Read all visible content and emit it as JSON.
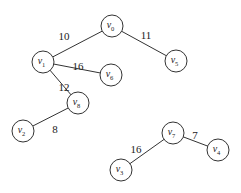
{
  "diagram": {
    "type": "weighted-graph",
    "node_radius": 11,
    "colors": {
      "stroke": "#333333",
      "fill": "#ffffff",
      "text": "#222222"
    },
    "nodes": [
      {
        "id": "v0",
        "label": "v",
        "sub": "0",
        "x": 112,
        "y": 26
      },
      {
        "id": "v1",
        "label": "v",
        "sub": "1",
        "x": 43,
        "y": 62
      },
      {
        "id": "v5",
        "label": "v",
        "sub": "5",
        "x": 176,
        "y": 61
      },
      {
        "id": "v6",
        "label": "v",
        "sub": "6",
        "x": 111,
        "y": 75
      },
      {
        "id": "v8",
        "label": "v",
        "sub": "8",
        "x": 78,
        "y": 103
      },
      {
        "id": "v2",
        "label": "v",
        "sub": "2",
        "x": 23,
        "y": 131
      },
      {
        "id": "v7",
        "label": "v",
        "sub": "7",
        "x": 173,
        "y": 133
      },
      {
        "id": "v3",
        "label": "v",
        "sub": "3",
        "x": 121,
        "y": 170
      },
      {
        "id": "v4",
        "label": "v",
        "sub": "4",
        "x": 218,
        "y": 150
      }
    ],
    "edges": [
      {
        "from": "v0",
        "to": "v1",
        "weight": "10",
        "lx": 64,
        "ly": 37
      },
      {
        "from": "v0",
        "to": "v5",
        "weight": "11",
        "lx": 146,
        "ly": 36
      },
      {
        "from": "v1",
        "to": "v6",
        "weight": "16",
        "lx": 78,
        "ly": 67
      },
      {
        "from": "v1",
        "to": "v8",
        "weight": "12",
        "lx": 64,
        "ly": 88
      },
      {
        "from": "v8",
        "to": "v2",
        "weight": "8",
        "lx": 55,
        "ly": 130
      },
      {
        "from": "v7",
        "to": "v3",
        "weight": "16",
        "lx": 136,
        "ly": 150
      },
      {
        "from": "v7",
        "to": "v4",
        "weight": "7",
        "lx": 195,
        "ly": 136
      }
    ]
  }
}
